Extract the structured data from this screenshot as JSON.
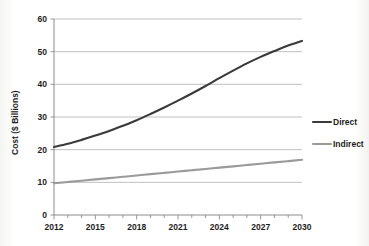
{
  "chart_data": {
    "type": "line",
    "title": "",
    "xlabel": "",
    "ylabel": "Cost ($ Billions)",
    "xlim": [
      2012,
      2030
    ],
    "ylim": [
      0,
      60
    ],
    "grid": "horizontal",
    "legend_position": "right",
    "y_ticks": [
      "0",
      "10",
      "20",
      "30",
      "40",
      "50",
      "60"
    ],
    "y_tick_values": [
      0,
      10,
      20,
      30,
      40,
      50,
      60
    ],
    "x_ticks": [
      "2012",
      "2015",
      "2018",
      "2021",
      "2024",
      "2027",
      "2030"
    ],
    "x_tick_values": [
      2012,
      2015,
      2018,
      2021,
      2024,
      2027,
      2030
    ],
    "x_minor_tick_values": [
      2012,
      2013,
      2014,
      2015,
      2016,
      2017,
      2018,
      2019,
      2020,
      2021,
      2022,
      2023,
      2024,
      2025,
      2026,
      2027,
      2028,
      2029,
      2030
    ],
    "x": [
      2012,
      2013,
      2014,
      2015,
      2016,
      2017,
      2018,
      2019,
      2020,
      2021,
      2022,
      2023,
      2024,
      2025,
      2026,
      2027,
      2028,
      2029,
      2030
    ],
    "series": [
      {
        "name": "Direct",
        "color": "#3a3a3a",
        "values": [
          20.8,
          21.8,
          23.0,
          24.3,
          25.7,
          27.3,
          29.0,
          30.9,
          32.9,
          35.0,
          37.2,
          39.5,
          41.9,
          44.2,
          46.4,
          48.4,
          50.2,
          51.9,
          53.3
        ]
      },
      {
        "name": "Indirect",
        "color": "#9a9a9a",
        "values": [
          9.7,
          10.1,
          10.5,
          10.9,
          11.3,
          11.7,
          12.1,
          12.5,
          12.9,
          13.3,
          13.7,
          14.1,
          14.5,
          14.9,
          15.3,
          15.7,
          16.1,
          16.5,
          16.9
        ]
      }
    ]
  },
  "legend": {
    "items": [
      {
        "label": "Direct",
        "color": "#3a3a3a"
      },
      {
        "label": "Indirect",
        "color": "#9a9a9a"
      }
    ]
  },
  "axes": {
    "y_title": "Cost ($ Billions)"
  },
  "colors": {
    "direct": "#3a3a3a",
    "indirect": "#9a9a9a",
    "gridline": "#b9b9b9",
    "axis": "#8c8c8c",
    "text": "#1d1d1d",
    "background": "#ffffff"
  }
}
